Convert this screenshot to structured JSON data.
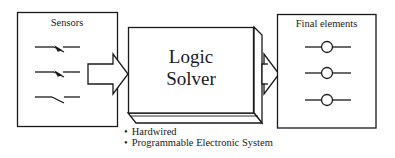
{
  "diagram": {
    "sensors": {
      "title": "Sensors",
      "symbols": [
        "switch-normally-open-icon",
        "switch-normally-open-icon",
        "switch-open-icon"
      ]
    },
    "logic_solver": {
      "line1": "Logic",
      "line2": "Solver",
      "types": [
        "Hardwired",
        "Programmable Electronic System"
      ]
    },
    "final_elements": {
      "title": "Final elements",
      "symbols": [
        "valve-icon",
        "valve-icon",
        "valve-icon"
      ]
    },
    "arrows": [
      "sensors-to-logic-solver",
      "logic-solver-to-final-elements"
    ],
    "colors": {
      "line": "#1a1a1a",
      "background": "#ffffff"
    }
  }
}
